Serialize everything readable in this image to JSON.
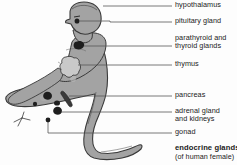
{
  "diagram": {
    "title": "endocrine glands",
    "subtitle": "(of human female)",
    "colors": {
      "background": "#fdfdfd",
      "body_fill": "#a3a3a3",
      "body_outline": "#3a3a3a",
      "organ_dark": "#1e1e1e",
      "organ_light": "#c9c9c9",
      "leader_line": "#555555",
      "text": "#1b1b1b"
    },
    "labels": [
      {
        "id": "hypothalamus",
        "text": "hypothalamus",
        "line_y": 6,
        "text_x": 175,
        "text_y": 2,
        "leader_from_x": 103,
        "leader_to_x": 172
      },
      {
        "id": "pituitary-gland",
        "text": "pituitary gland",
        "line_y": 22,
        "text_x": 175,
        "text_y": 18,
        "leader_from_x": 77,
        "leader_to_x": 172
      },
      {
        "id": "parathyroid-and-thyroid-glands",
        "text": "parathyroid and\nthyroid glands",
        "line_y": 46,
        "text_x": 175,
        "text_y": 34,
        "leader_from_x": 79,
        "leader_to_x": 172
      },
      {
        "id": "thymus",
        "text": "thymus",
        "line_y": 65,
        "text_x": 175,
        "text_y": 61,
        "leader_from_x": 72,
        "leader_to_x": 172
      },
      {
        "id": "pancreas",
        "text": "pancreas",
        "line_y": 96,
        "text_x": 175,
        "text_y": 92,
        "leader_from_x": 65,
        "leader_to_x": 172
      },
      {
        "id": "adrenal-gland-and-kidneys",
        "text": "adrenal gland\nand kidneys",
        "line_y": 112,
        "text_x": 175,
        "text_y": 108,
        "leader_from_x": 60,
        "leader_to_x": 172
      },
      {
        "id": "gonad",
        "text": "gonad",
        "line_y": 133,
        "text_x": 175,
        "text_y": 129,
        "leader_from_x": 49,
        "leader_to_x": 172
      }
    ],
    "organs": [
      {
        "id": "pituitary-marker",
        "label": "pituitary gland",
        "shape": "dot"
      },
      {
        "id": "thyroid-marker",
        "label": "thyroid gland",
        "shape": "blob"
      },
      {
        "id": "thymus-marker",
        "label": "thymus",
        "shape": "lobed"
      },
      {
        "id": "pancreas-marker",
        "label": "pancreas",
        "shape": "elongated"
      },
      {
        "id": "adrenal-marker",
        "label": "adrenal gland",
        "shape": "blob"
      },
      {
        "id": "kidney-marker",
        "label": "kidney",
        "shape": "bean"
      },
      {
        "id": "gonad-marker",
        "label": "gonad",
        "shape": "dot"
      }
    ]
  }
}
